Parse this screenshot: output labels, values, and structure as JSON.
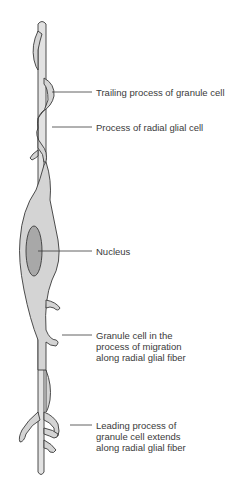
{
  "diagram": {
    "colors": {
      "background": "#ffffff",
      "glial_fiber": "#e2e2e2",
      "cell_body": "#d4d4d4",
      "nucleus": "#a8a8a8",
      "outline": "#3a3a3a",
      "leader_line": "#3a3a3a",
      "label_text": "#3a3a3a"
    },
    "labels": [
      {
        "id": "trailing-process",
        "text": "Trailing process of granule cell",
        "y": 87
      },
      {
        "id": "radial-glial-process",
        "text": "Process of radial glial cell",
        "y": 122
      },
      {
        "id": "nucleus",
        "text": "Nucleus",
        "y": 246
      },
      {
        "id": "migrating-granule-cell",
        "text": "Granule cell in the\nprocess of migration\nalong radial glial fiber",
        "y": 330
      },
      {
        "id": "leading-process",
        "text": "Leading process of\ngranule cell extends\nalong radial glial fiber",
        "y": 420
      }
    ]
  }
}
